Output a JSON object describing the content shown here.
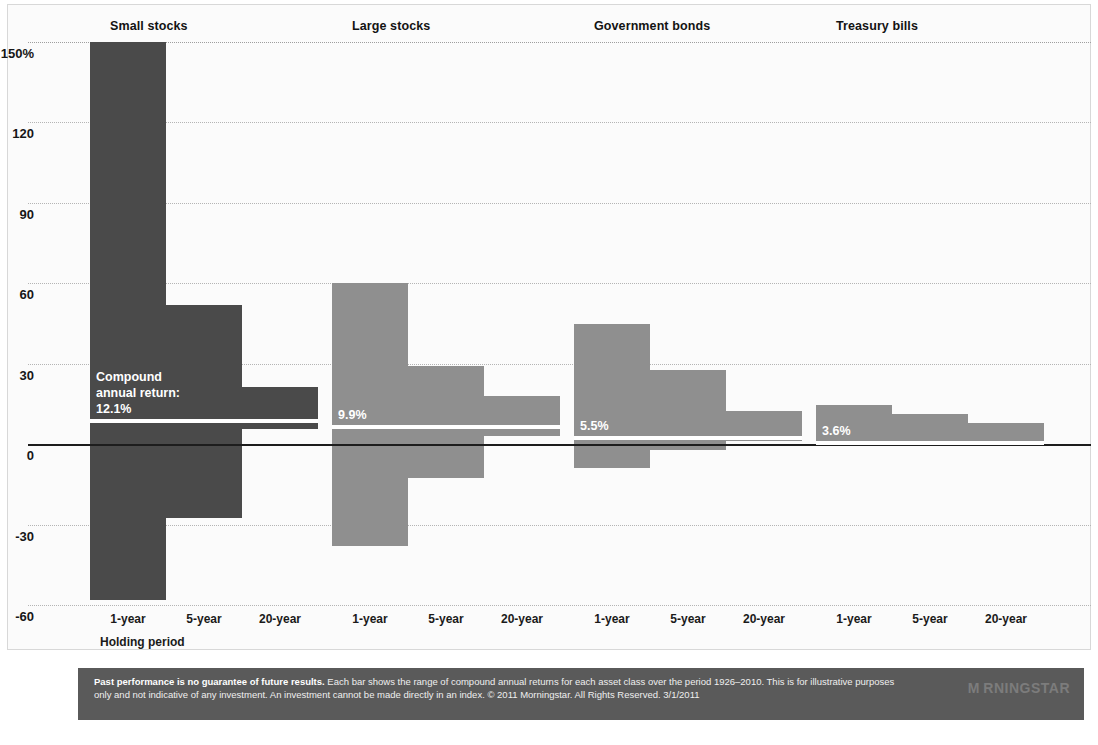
{
  "chart_data": {
    "type": "bar",
    "title": "",
    "subtitle": "",
    "xlabel": "Holding period",
    "ylabel": "",
    "ylim": [
      -60,
      150
    ],
    "yticks": [
      150,
      120,
      90,
      60,
      30,
      0,
      -30,
      -60
    ],
    "ytick_labels": [
      "150%",
      "120",
      "90",
      "60",
      "30",
      "0",
      "-30",
      "-60"
    ],
    "grid": true,
    "legend_position": "none",
    "zero_line": 0,
    "annotation_caption": [
      "Compound",
      "annual return:"
    ],
    "categories": [
      "1-year",
      "5-year",
      "20-year"
    ],
    "groups": [
      {
        "name": "Small stocks",
        "color": "#4a4a4a",
        "compound_annual_return": "12.1%",
        "bars": [
          {
            "period": "1-year",
            "high": 150.0,
            "low": -58.0
          },
          {
            "period": "5-year",
            "high": 52.0,
            "low": -27.5
          },
          {
            "period": "20-year",
            "high": 21.5,
            "low": 5.7
          }
        ]
      },
      {
        "name": "Large stocks",
        "color": "#8f8f8f",
        "compound_annual_return": "9.9%",
        "bars": [
          {
            "period": "1-year",
            "high": 60.0,
            "low": -38.0
          },
          {
            "period": "5-year",
            "high": 29.0,
            "low": -12.5
          },
          {
            "period": "20-year",
            "high": 18.0,
            "low": 3.1
          }
        ]
      },
      {
        "name": "Government bonds",
        "color": "#8f8f8f",
        "compound_annual_return": "5.5%",
        "bars": [
          {
            "period": "1-year",
            "high": 45.0,
            "low": -9.0
          },
          {
            "period": "5-year",
            "high": 27.5,
            "low": -2.2
          },
          {
            "period": "20-year",
            "high": 12.5,
            "low": 1.0
          }
        ]
      },
      {
        "name": "Treasury bills",
        "color": "#8f8f8f",
        "compound_annual_return": "3.6%",
        "bars": [
          {
            "period": "1-year",
            "high": 14.7,
            "low": 0.0
          },
          {
            "period": "5-year",
            "high": 11.1,
            "low": 0.1
          },
          {
            "period": "20-year",
            "high": 7.7,
            "low": 0.4
          }
        ]
      }
    ]
  },
  "footer": {
    "lead": "Past performance is no guarantee of future results.",
    "body": " Each bar shows the range of compound annual returns for each asset class over the period 1926–2010. This is for illustrative purposes only and not indicative of any investment. An investment cannot be made directly in an index. © 2011 Morningstar. All Rights Reserved. 3/1/2011",
    "brand": "M RNINGSTAR"
  }
}
